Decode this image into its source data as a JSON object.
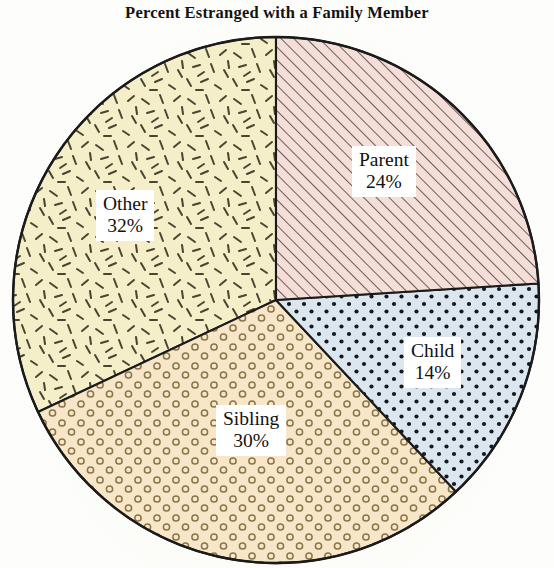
{
  "chart_data": {
    "type": "pie",
    "title": "Percent Estranged with a Family Member",
    "xlabel": "",
    "ylabel": "",
    "legend_position": "none",
    "grid": false,
    "value_unit": "%",
    "start_angle_deg": 0,
    "direction": "clockwise",
    "categories": [
      "Parent",
      "Child",
      "Sibling",
      "Other"
    ],
    "values": [
      24,
      14,
      30,
      32
    ],
    "slices": [
      {
        "label": "Parent",
        "value": 24,
        "value_text": "24%",
        "color": "#f5ded8",
        "pattern": "diagonal-hatch",
        "pattern_color": "#3a3330",
        "start_deg": 0,
        "end_deg": 86.4
      },
      {
        "label": "Child",
        "value": 14,
        "value_text": "14%",
        "color": "#dce6ef",
        "pattern": "dot-grid",
        "pattern_color": "#15181c",
        "start_deg": 86.4,
        "end_deg": 136.8
      },
      {
        "label": "Sibling",
        "value": 30,
        "value_text": "30%",
        "color": "#f7e6c8",
        "pattern": "small-rings",
        "pattern_color": "#8a7548",
        "start_deg": 136.8,
        "end_deg": 244.8
      },
      {
        "label": "Other",
        "value": 32,
        "value_text": "32%",
        "color": "#f4efc9",
        "pattern": "scattered-dashes",
        "pattern_color": "#4a4432",
        "start_deg": 244.8,
        "end_deg": 360
      }
    ],
    "outline_color": "#1b1b1b",
    "background_color": "#fdfdfb"
  },
  "labels": {
    "parent": {
      "name": "Parent",
      "pct": "24%"
    },
    "child": {
      "name": "Child",
      "pct": "14%"
    },
    "sibling": {
      "name": "Sibling",
      "pct": "30%"
    },
    "other": {
      "name": "Other",
      "pct": "32%"
    }
  }
}
